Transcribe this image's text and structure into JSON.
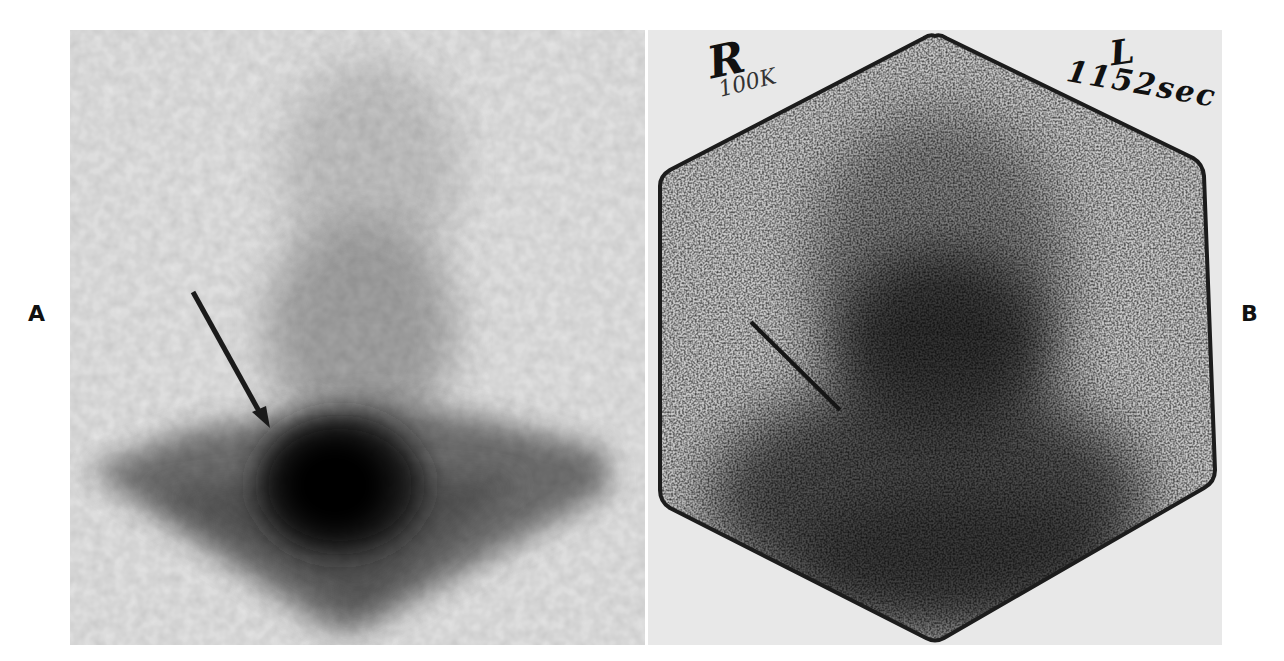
{
  "figure": {
    "panels": [
      {
        "id": "A",
        "label": "A",
        "description": "Blurred grayscale scintigraphic image with a dark central uptake focus and a diagonal arrow pointing to it",
        "arrow": {
          "direction": "down-right",
          "color": "#1a1a1a"
        }
      },
      {
        "id": "B",
        "label": "B",
        "description": "Grainy hexagonal gamma-camera image with central dark uptake and a thin diagonal arrow line",
        "annotations": {
          "top_left_letter": "R",
          "top_left_count": "100K",
          "top_right_letter": "L",
          "top_right_count": "1152sec"
        },
        "arrow": {
          "direction": "down-right",
          "color": "#1a1a1a"
        }
      }
    ]
  },
  "colors": {
    "background": "#ffffff",
    "panel_a_background": "#e6e6e6",
    "panel_b_background": "#e8e8e8",
    "uptake_dark": "#0e0e0e",
    "label": "#111111"
  }
}
